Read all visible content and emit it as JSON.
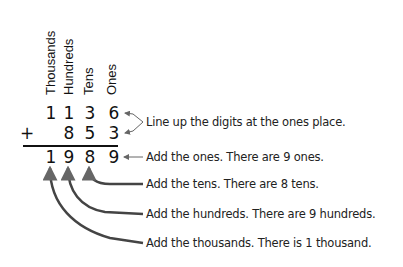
{
  "diagram": {
    "type": "column-addition-explanation",
    "place_value_headers": [
      "Thousands",
      "Hundreds",
      "Tens",
      "Ones"
    ],
    "addend_1": [
      "1",
      "1",
      "3",
      "6"
    ],
    "operator": "+",
    "addend_2": [
      "",
      "8",
      "5",
      "3"
    ],
    "sum": [
      "1",
      "9",
      "8",
      "9"
    ],
    "notes": {
      "align": "Line up the digits at the ones place.",
      "ones": "Add the ones. There are 9 ones.",
      "tens": "Add the tens. There are 8 tens.",
      "hundreds": "Add the hundreds. There are 9 hundreds.",
      "thousands": "Add the thousands. There is 1 thousand."
    },
    "colors": {
      "text": "#111111",
      "arrow": "#555555",
      "background": "#ffffff"
    }
  }
}
